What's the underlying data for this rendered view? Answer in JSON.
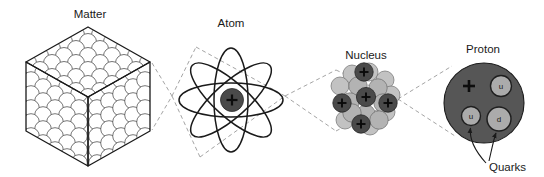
{
  "diagram": {
    "title_visible": false,
    "background_color": "#ffffff",
    "width": 544,
    "height": 177,
    "stages": [
      {
        "id": "matter",
        "label": "Matter",
        "label_x": 90,
        "label_y": 18,
        "icon": "isometric-cube-of-spheres",
        "description": "Isometric cube built of close-packed spheres",
        "colors": {
          "outline": "#2b2b2b",
          "fill": "#ffffff"
        }
      },
      {
        "id": "atom",
        "label": "Atom",
        "label_x": 231,
        "label_y": 27,
        "icon": "atom-orbits",
        "description": "Four elliptical electron orbits around a central nucleus",
        "orbit_count": 4,
        "nucleus_charge": "+",
        "colors": {
          "orbit": "#1a1a1a",
          "nucleus": "#4a4a4a",
          "charge": "#0d0d0d"
        }
      },
      {
        "id": "nucleus",
        "label": "Nucleus",
        "label_x": 366,
        "label_y": 59,
        "icon": "nucleon-cluster",
        "description": "Cluster of protons (dark, marked +) and neutrons (light gray)",
        "proton_count": 5,
        "neutron_count": 15,
        "colors": {
          "proton": "#4a4a4a",
          "neutron": "#b8b8b8",
          "outline": "#2b2b2b"
        }
      },
      {
        "id": "proton",
        "label": "Proton",
        "label_x": 483,
        "label_y": 53,
        "icon": "proton-with-quarks",
        "description": "Proton sphere containing three quarks",
        "charge": "+",
        "quarks": [
          {
            "flavor": "u",
            "cx": 498,
            "cy": 89
          },
          {
            "flavor": "u",
            "cx": 473,
            "cy": 116
          },
          {
            "flavor": "d",
            "cx": 499,
            "cy": 119
          }
        ],
        "colors": {
          "body": "#565656",
          "quark": "#ababab",
          "outline": "#1a1a1a",
          "charge": "#0d0d0d"
        }
      }
    ],
    "annotations": [
      {
        "id": "quarks-callout",
        "label": "Quarks",
        "label_x": 489,
        "label_y": 171,
        "arrow_targets": [
          "quark-u-lower-left",
          "quark-d"
        ],
        "color": "#1a1a1a"
      }
    ],
    "connectors": [
      {
        "id": "matter-to-atom",
        "style": "dashed",
        "color": "#9a9a9a"
      },
      {
        "id": "atom-to-nucleus",
        "style": "dashed",
        "color": "#9a9a9a"
      },
      {
        "id": "nucleus-to-proton",
        "style": "dashed",
        "color": "#9a9a9a"
      }
    ]
  }
}
